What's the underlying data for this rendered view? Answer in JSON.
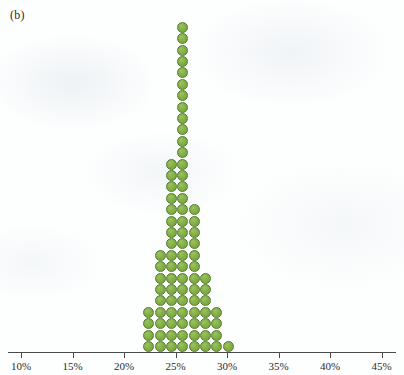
{
  "panel": {
    "label": "(b)"
  },
  "colors": {
    "dot_fill": "#86b049",
    "dot_stroke": "#4e7a2a",
    "axis": "#4a4a4a",
    "background": "#fdfefe",
    "text": "#2b2b2b"
  },
  "chart_data": {
    "type": "bar",
    "title": "",
    "subtitle": "",
    "xlabel": "",
    "ylabel": "",
    "plot_style": "dot-plot (stacked dot histogram)",
    "orientation": "vertical",
    "xlim": [
      10,
      45
    ],
    "grid": false,
    "legend": null,
    "axis_ticks": [
      {
        "value": 10,
        "label": "10%"
      },
      {
        "value": 15,
        "label": "15%"
      },
      {
        "value": 20,
        "label": "20%"
      },
      {
        "value": 25,
        "label": "25%"
      },
      {
        "value": 30,
        "label": "30%"
      },
      {
        "value": 35,
        "label": "35%"
      },
      {
        "value": 40,
        "label": "40%"
      },
      {
        "value": 45,
        "label": "45%"
      }
    ],
    "tick_labels": [
      "10%",
      "15%",
      "20%",
      "25%",
      "30%",
      "35%",
      "40%",
      "45%"
    ],
    "tick_step": 5,
    "dot_unit": 1,
    "categories": [
      "22.4%",
      "23.5%",
      "24.6%",
      "25.7%",
      "26.8%",
      "27.9%",
      "29.0%",
      "30.1%"
    ],
    "x": [
      22.4,
      23.5,
      24.6,
      25.7,
      26.8,
      27.9,
      29.0,
      30.1
    ],
    "values": [
      4,
      9,
      17,
      29,
      13,
      7,
      4,
      1
    ],
    "total_count": 84,
    "max_stack": 29,
    "annotations": []
  }
}
